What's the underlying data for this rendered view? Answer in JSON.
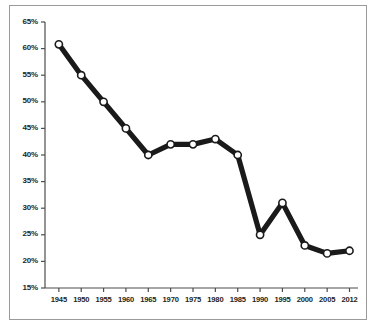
{
  "chart_data": {
    "type": "line",
    "title": "",
    "subtitle": "",
    "xlabel": "",
    "ylabel": "",
    "categories": [
      "1945",
      "1950",
      "1955",
      "1960",
      "1965",
      "1970",
      "1975",
      "1980",
      "1985",
      "1990",
      "1995",
      "2000",
      "2005",
      "2012"
    ],
    "values": [
      60.8,
      55.0,
      50.0,
      45.0,
      40.0,
      42.0,
      42.0,
      43.0,
      40.0,
      25.0,
      31.0,
      23.0,
      21.5,
      22.0
    ],
    "value_labels": [
      "60.8%",
      "55%",
      "50%",
      "45%",
      "40%",
      "42%",
      "42%",
      "43%",
      "40%",
      "25%",
      "31%",
      "23%",
      "21.5%",
      "22%"
    ],
    "ylim": [
      15,
      65
    ],
    "ytick_values": [
      65,
      60,
      55,
      50,
      45,
      40,
      35,
      30,
      25,
      20,
      15
    ],
    "ytick_labels": [
      "65%",
      "60%",
      "55%",
      "50%",
      "45%",
      "40%",
      "35%",
      "30%",
      "25%",
      "20%",
      "15%"
    ],
    "xtick_labels": [
      "1945",
      "1950",
      "1955",
      "1960",
      "1965",
      "1970",
      "1975",
      "1980",
      "1985",
      "1990",
      "1995",
      "2000",
      "2005",
      "2012"
    ],
    "grid": false,
    "legend": null,
    "legend_position": "none",
    "series": [
      {
        "name": "series-1",
        "values": [
          60.8,
          55.0,
          50.0,
          45.0,
          40.0,
          42.0,
          42.0,
          43.0,
          40.0,
          25.0,
          31.0,
          23.0,
          21.5,
          22.0
        ],
        "line_color": "#1a1a1a",
        "marker": "circle-open",
        "marker_fill": "#ffffff",
        "marker_edge": "#1a1a1a"
      }
    ]
  },
  "style": {
    "axis_color": "#4d4d4d",
    "frame_color": "#9a9a9a",
    "line_color": "#1a1a1a",
    "marker_fill": "#ffffff",
    "background": "#ffffff",
    "tick_text_color": "#231f20"
  },
  "caption": {
    "text": ""
  }
}
